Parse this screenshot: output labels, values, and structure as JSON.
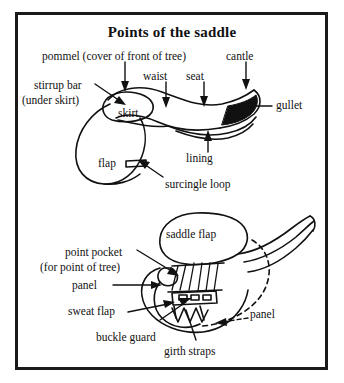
{
  "figure": {
    "title": "Points of the saddle",
    "type": "labelled-line-diagram",
    "views": [
      {
        "name": "upper-view",
        "description": "side/top view of whole saddle"
      },
      {
        "name": "lower-view",
        "description": "underside view showing panel and girth straps"
      }
    ]
  },
  "labels": {
    "pommel": "pommel (cover of front of tree)",
    "cantle": "cantle",
    "stirrup_bar_line1": "stirrup bar",
    "stirrup_bar_line2": "(under skirt)",
    "waist": "waist",
    "seat": "seat",
    "skirt": "skirt",
    "gullet": "gullet",
    "lining": "lining",
    "flap": "flap",
    "surcingle_loop": "surcingle loop",
    "saddle_flap": "saddle flap",
    "point_pocket_line1": "point pocket",
    "point_pocket_line2": "(for point of tree)",
    "panel_left": "panel",
    "panel_right": "panel",
    "sweat_flap": "sweat flap",
    "buckle_guard": "buckle guard",
    "girth_straps": "girth straps"
  },
  "colors": {
    "ink": "#111111",
    "frame": "#1a1a1a",
    "paper": "#ffffff"
  }
}
